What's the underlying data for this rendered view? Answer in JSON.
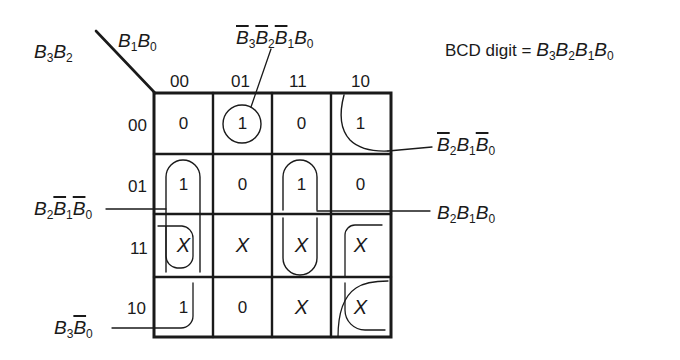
{
  "bcd_label": {
    "prefix": "BCD digit = ",
    "vars": [
      {
        "letter": "B",
        "sub": "3",
        "bar": false
      },
      {
        "letter": "B",
        "sub": "2",
        "bar": false
      },
      {
        "letter": "B",
        "sub": "1",
        "bar": false
      },
      {
        "letter": "B",
        "sub": "0",
        "bar": false
      }
    ]
  },
  "axes": {
    "row_vars": "B3B2",
    "col_vars": "B1B0",
    "row_label": [
      {
        "letter": "B",
        "sub": "3"
      },
      {
        "letter": "B",
        "sub": "2"
      }
    ],
    "col_label": [
      {
        "letter": "B",
        "sub": "1"
      },
      {
        "letter": "B",
        "sub": "0"
      }
    ],
    "col_codes": [
      "00",
      "01",
      "11",
      "10"
    ],
    "row_codes": [
      "00",
      "01",
      "11",
      "10"
    ]
  },
  "cells": [
    [
      "0",
      "1",
      "0",
      "1"
    ],
    [
      "1",
      "0",
      "1",
      "0"
    ],
    [
      "X",
      "X",
      "X",
      "X"
    ],
    [
      "1",
      "0",
      "X",
      "X"
    ]
  ],
  "groups": [
    {
      "id": "g1",
      "term": "B̄3B̄2B̄1B0",
      "cells": [
        [
          0,
          1
        ]
      ],
      "shape": "circle",
      "label_pos": "top"
    },
    {
      "id": "g2",
      "term": "B̄2B1B̄0",
      "cells": [
        [
          0,
          3
        ]
      ],
      "shape": "corner-quarter",
      "label_pos": "right-upper"
    },
    {
      "id": "g3",
      "term": "B2B̄1B̄0",
      "cells": [
        [
          1,
          0
        ],
        [
          2,
          0
        ]
      ],
      "shape": "vertical-pill",
      "label_pos": "left-upper"
    },
    {
      "id": "g4",
      "term": "B2B1B0",
      "cells": [
        [
          1,
          2
        ],
        [
          2,
          2
        ]
      ],
      "shape": "vertical-pill",
      "label_pos": "right-lower"
    },
    {
      "id": "g5",
      "term": "B3B̄0",
      "cells": [
        [
          2,
          0
        ],
        [
          3,
          0
        ],
        [
          2,
          3
        ],
        [
          3,
          3
        ]
      ],
      "shape": "wrap-corners",
      "label_pos": "left-bottom"
    }
  ],
  "terms": {
    "g1": [
      {
        "letter": "B",
        "sub": "3",
        "bar": true
      },
      {
        "letter": "B",
        "sub": "2",
        "bar": true
      },
      {
        "letter": "B",
        "sub": "1",
        "bar": true
      },
      {
        "letter": "B",
        "sub": "0",
        "bar": false
      }
    ],
    "g2": [
      {
        "letter": "B",
        "sub": "2",
        "bar": true
      },
      {
        "letter": "B",
        "sub": "1",
        "bar": false
      },
      {
        "letter": "B",
        "sub": "0",
        "bar": true
      }
    ],
    "g3": [
      {
        "letter": "B",
        "sub": "2",
        "bar": false
      },
      {
        "letter": "B",
        "sub": "1",
        "bar": true
      },
      {
        "letter": "B",
        "sub": "0",
        "bar": true
      }
    ],
    "g4": [
      {
        "letter": "B",
        "sub": "2",
        "bar": false
      },
      {
        "letter": "B",
        "sub": "1",
        "bar": false
      },
      {
        "letter": "B",
        "sub": "0",
        "bar": false
      }
    ],
    "g5": [
      {
        "letter": "B",
        "sub": "3",
        "bar": false
      },
      {
        "letter": "B",
        "sub": "0",
        "bar": true
      }
    ]
  },
  "colors": {
    "ink": "#1a1a1a",
    "background": "#ffffff"
  }
}
